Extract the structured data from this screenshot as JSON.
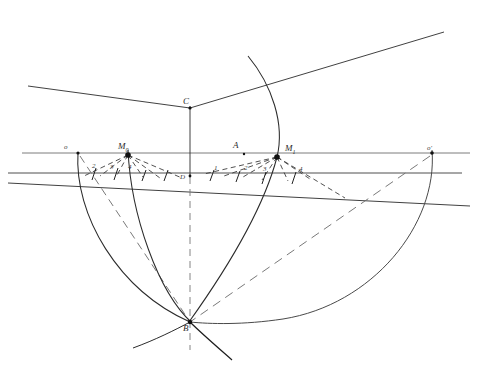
{
  "figure": {
    "kind": "hand-drawn-geometric-construction",
    "canvas": {
      "width": 500,
      "height": 375,
      "background": "#ffffff"
    },
    "ink": {
      "primary": "#1d1d1d",
      "secondary": "#4a4a4a",
      "light": "#6e6e6e"
    }
  },
  "labels": {
    "o": "o",
    "o_prime": "o'",
    "M0_base": "M",
    "M0_sub": "0",
    "M1_base": "M",
    "M1_sub": "1",
    "A": "A",
    "B": "B",
    "C": "C",
    "D": "D",
    "tick_1_left": "1",
    "tick_2_left": "2",
    "tick_3_left": "3",
    "tick_4_left": "4",
    "tick_1_right": "1",
    "tick_2_right": "2",
    "tick_3_right": "3",
    "tick_4_right": "4"
  },
  "points": {
    "o": {
      "x": 78,
      "y": 153
    },
    "o_prime": {
      "x": 432,
      "y": 153
    },
    "M0": {
      "x": 128,
      "y": 155
    },
    "M1": {
      "x": 277,
      "y": 157
    },
    "A": {
      "x": 238,
      "y": 149
    },
    "B": {
      "x": 190,
      "y": 322
    },
    "C": {
      "x": 190,
      "y": 107
    },
    "D": {
      "x": 190,
      "y": 176
    }
  },
  "label_positions": {
    "o": {
      "x": 64,
      "y": 146
    },
    "o_prime": {
      "x": 427,
      "y": 147
    },
    "M0": {
      "x": 121,
      "y": 144
    },
    "M1": {
      "x": 286,
      "y": 146
    },
    "A": {
      "x": 234,
      "y": 142
    },
    "B": {
      "x": 184,
      "y": 325
    },
    "C": {
      "x": 184,
      "y": 98
    },
    "D": {
      "x": 181,
      "y": 176
    },
    "tick_2_left": {
      "x": 94,
      "y": 165
    },
    "tick_3_left": {
      "x": 110,
      "y": 166
    },
    "tick_4_left": {
      "x": 127,
      "y": 166
    },
    "tick_1_right": {
      "x": 216,
      "y": 167
    },
    "tick_2_right": {
      "x": 246,
      "y": 167
    },
    "tick_3_right": {
      "x": 264,
      "y": 167
    },
    "tick_4_right": {
      "x": 300,
      "y": 167
    }
  },
  "lines": {
    "upper_horizontal": {
      "x1": 22,
      "y1": 153,
      "x2": 470,
      "y2": 153
    },
    "lower_horizontal": {
      "x1": 8,
      "y1": 173,
      "x2": 462,
      "y2": 173
    },
    "oblique_through_D": {
      "x1": 8,
      "y1": 183,
      "x2": 470,
      "y2": 205
    },
    "ray_left_to_C": {
      "x1": 28,
      "y1": 86,
      "x2": 190,
      "y2": 108
    },
    "ray_C_to_upper_right": {
      "x1": 190,
      "y1": 108,
      "x2": 444,
      "y2": 32
    },
    "vertical_C_to_D": {
      "x1": 190,
      "y1": 107,
      "x2": 190,
      "y2": 176
    },
    "vertical_axis_dashed": {
      "x1": 190,
      "y1": 176,
      "x2": 190,
      "y2": 348
    },
    "chord_o_to_B": {
      "x1": 78,
      "y1": 153,
      "x2": 190,
      "y2": 322
    },
    "chord_oprime_to_B": {
      "x1": 432,
      "y1": 153,
      "x2": 190,
      "y2": 322
    }
  },
  "arcs": {
    "arc_o_B": {
      "from": "o",
      "to": "B",
      "note": "left solid arc"
    },
    "arc_M0_B": {
      "from": "M0",
      "to": "B",
      "note": "inner left solid arc"
    },
    "arc_M1_B": {
      "from": "M1",
      "to": "B",
      "note": "inner right solid arc through upper region"
    },
    "arc_oprime_B": {
      "from": "o'",
      "to": "B",
      "note": "large right solid arc"
    },
    "arc_big_top": {
      "note": "tall arc rising from B past M1 to top of canvas"
    }
  },
  "fans": {
    "M0_rays": 6,
    "M1_rays": 7,
    "style": "dashed"
  }
}
